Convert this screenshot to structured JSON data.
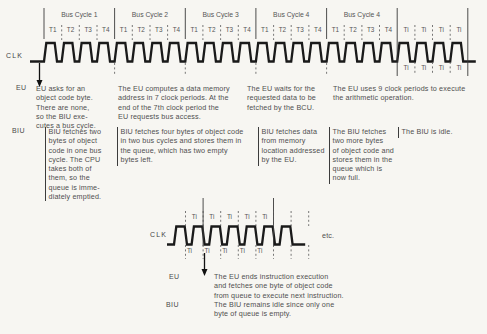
{
  "colors": {
    "background": "#f7f6f2",
    "ink": "#4f4f4f",
    "line": "#333333",
    "waveform": "#1a1a1a"
  },
  "top_diagram": {
    "clk_label": "CLK",
    "bus_cycles": [
      {
        "label": "Bus Cycle 1",
        "t_states": [
          "T1",
          "T2",
          "T3",
          "T4"
        ]
      },
      {
        "label": "Bus Cycle 2",
        "t_states": [
          "T1",
          "T2",
          "T3",
          "T4"
        ]
      },
      {
        "label": "Bus Cycle 3",
        "t_states": [
          "T1",
          "T2",
          "T3",
          "T4"
        ]
      },
      {
        "label": "Bus Cycle 4",
        "t_states": [
          "T1",
          "T2",
          "T3",
          "T4"
        ]
      },
      {
        "label": "Bus Cycle 4",
        "t_states": [
          "T1",
          "T2",
          "T3",
          "T4"
        ]
      }
    ],
    "idle_above": [
      "Ti",
      "Ti",
      "Ti",
      "Ti"
    ],
    "idle_below": [
      "Ti",
      "Ti",
      "Ti",
      "Ti"
    ]
  },
  "top_annotations": {
    "eu_label": "EU",
    "biu_label": "BIU",
    "eu_notes": [
      "EU asks for an\nobject code byte.\nThere are none,\nso the BIU exe-\ncutes a bus cycle.",
      "The EU computes a data memory\naddress in 7 clock periods. At the\nend of the 7th clock period the\nEU requests bus access.",
      "The EU waits for the\nrequested data to be\nfetched by the BCU.",
      "The EU uses 9 clock periods to execute\nthe arithmetic operation."
    ],
    "biu_notes": [
      "BIU fetches two\nbytes of object\ncode in one bus\ncycle. The CPU\ntakes both of\nthem, so the\nqueue is imme-\ndiately emptied.",
      "BIU fetches four bytes of object code\nin two bus cycles and stores them in\nthe queue, which has two empty\nbytes left.",
      "BIU fetches data\nfrom memory\nlocation addressed\nby the EU.",
      "The BIU fetches\ntwo more bytes\nof object code and\nstores them in the\nqueue which is\nnow full.",
      "The BIU is idle."
    ]
  },
  "bottom_diagram": {
    "clk_label": "CLK",
    "idle_above": [
      "Ti",
      "Ti",
      "Ti",
      "Ti",
      "Ti"
    ],
    "idle_below": [
      "Ti",
      "Ti",
      "Ti",
      "Ti",
      "Ti"
    ],
    "etc_label": "etc."
  },
  "bottom_annotations": {
    "eu_label": "EU",
    "eu_note": "The EU ends instruction execution\nand fetches one byte of object code\nfrom queue to execute next instruction.",
    "biu_label": "BIU",
    "biu_note": "The BIU remains idle since only one\nbyte of queue is empty."
  }
}
